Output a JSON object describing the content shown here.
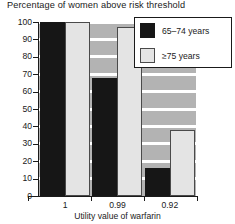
{
  "chart_data": {
    "type": "bar",
    "title": "Percentage of women above risk threshold",
    "xlabel": "Utility value of warfarin",
    "ylabel": "",
    "categories": [
      "1",
      "0.99",
      "0.92"
    ],
    "series": [
      {
        "name": "65–74 years",
        "color": "#161616",
        "values": [
          100,
          68,
          16
        ]
      },
      {
        "name": "≥75 years",
        "color": "#e4e4e4",
        "values": [
          100,
          97,
          38
        ]
      }
    ],
    "ylim": [
      0,
      100
    ],
    "yticks": [
      0,
      10,
      20,
      30,
      40,
      50,
      60,
      70,
      80,
      90,
      100
    ],
    "ytick_labels": [
      "0",
      "10",
      "20",
      "30",
      "40",
      "50",
      "60",
      "70",
      "80",
      "90",
      "100"
    ],
    "grid": true,
    "grid_color": "#ffffff",
    "plot_background": "#b3b3b3",
    "legend_position": "top-right"
  },
  "legend": {
    "items": [
      {
        "label": "65–74 years",
        "swatch": "dark"
      },
      {
        "label": "≥75 years",
        "swatch": "light"
      }
    ]
  }
}
